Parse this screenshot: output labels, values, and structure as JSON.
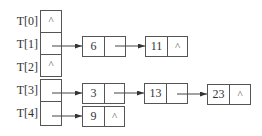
{
  "diagram": {
    "null_symbol": "^",
    "slots": [
      {
        "label": "T[0]",
        "chain": []
      },
      {
        "label": "T[1]",
        "chain": [
          "6",
          "11"
        ]
      },
      {
        "label": "T[2]",
        "chain": []
      },
      {
        "label": "T[3]",
        "chain": [
          "3",
          "13",
          "23"
        ]
      },
      {
        "label": "T[4]",
        "chain": [
          "9"
        ]
      }
    ]
  }
}
